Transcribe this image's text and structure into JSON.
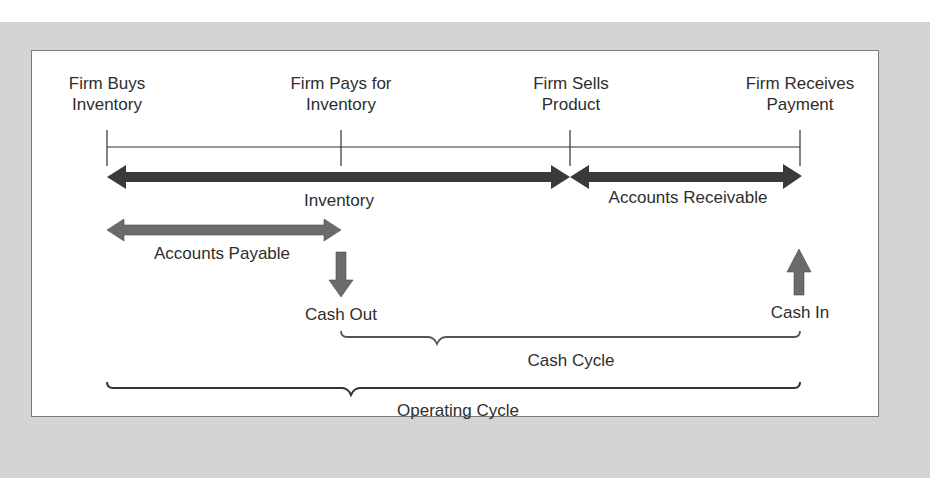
{
  "diagram": {
    "title_events": [
      {
        "line1": "Firm Buys",
        "line2": "Inventory"
      },
      {
        "line1": "Firm Pays for",
        "line2": "Inventory"
      },
      {
        "line1": "Firm Sells",
        "line2": "Product"
      },
      {
        "line1": "Firm Receives",
        "line2": "Payment"
      }
    ],
    "periods": {
      "inventory": "Inventory",
      "accounts_receivable": "Accounts Receivable",
      "accounts_payable": "Accounts Payable"
    },
    "cash_flows": {
      "cash_out": "Cash Out",
      "cash_in": "Cash In"
    },
    "cycles": {
      "cash_cycle": "Cash Cycle",
      "operating_cycle": "Operating Cycle"
    },
    "colors": {
      "background": "#d4d4d4",
      "panel": "#ffffff",
      "dark_arrow": "#3a3a3a",
      "medium_arrow": "#6b6b6b",
      "line": "#333333"
    }
  }
}
